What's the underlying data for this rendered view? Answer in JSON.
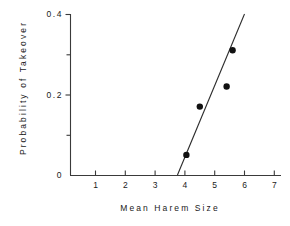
{
  "chart_data": {
    "type": "scatter",
    "title": "",
    "xlabel": "Mean Harem Size",
    "ylabel": "Probability of Takeover",
    "xlim": [
      0.35,
      7.4
    ],
    "ylim": [
      0,
      0.4
    ],
    "grid": false,
    "legend": null,
    "x_ticks": [
      1,
      2,
      3,
      4,
      5,
      6,
      7
    ],
    "x_tick_labels": [
      "1",
      "2",
      "3",
      "4",
      "5",
      "6",
      "7"
    ],
    "y_ticks": [
      0,
      0.1,
      0.2,
      0.3,
      0.4
    ],
    "y_tick_labels": [
      "0",
      "",
      "0.2",
      "",
      "0.4"
    ],
    "y_major_ticks": [
      0,
      0.2,
      0.4
    ],
    "y_minor_ticks": [
      0.1,
      0.3
    ],
    "points": [
      {
        "x": 4.05,
        "y": 0.05
      },
      {
        "x": 4.5,
        "y": 0.17
      },
      {
        "x": 5.4,
        "y": 0.22
      },
      {
        "x": 5.6,
        "y": 0.31
      }
    ],
    "fit_line": {
      "name": "regression line",
      "x_start": 3.75,
      "y_start": 0.0,
      "x_end": 6.0,
      "y_end": 0.4
    },
    "marker": "filled-circle",
    "marker_color": "#111111",
    "line_color": "#2b2b2b",
    "axis_color": "#3a3a3a",
    "background": "#ffffff"
  },
  "axis_labels": {
    "y_0": "0",
    "y_0_2": "0.2",
    "y_0_4": "0.4",
    "x_1": "1",
    "x_2": "2",
    "x_3": "3",
    "x_4": "4",
    "x_5": "5",
    "x_6": "6",
    "x_7": "7"
  }
}
